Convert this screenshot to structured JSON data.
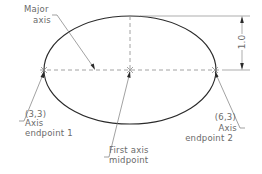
{
  "diagram": {
    "type": "ellipse-construction",
    "ellipse": {
      "cx": 130,
      "cy": 70,
      "rx": 86,
      "ry": 54
    },
    "labels": {
      "major_axis": [
        "Major",
        "axis"
      ],
      "endpoint1": {
        "coord": "(3,3)",
        "line1": "Axis",
        "line2": "endpoint  1"
      },
      "endpoint2": {
        "coord": "(6,3)",
        "line1": "Axis",
        "line2": "endpoint  2"
      },
      "midpoint": {
        "line1": "First  axis",
        "line2": "midpoint"
      },
      "dimension": "1.0"
    },
    "colors": {
      "ellipse": "#2a2a2a",
      "text": "#6a6a6a",
      "construction": "#8a8a8a"
    }
  }
}
